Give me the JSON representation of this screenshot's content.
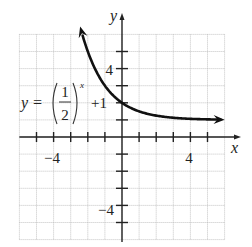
{
  "chart_data": {
    "type": "line",
    "title": "",
    "function": "y = (1/2)^x + 1",
    "equation_label": {
      "lhs": "y =",
      "numerator": "1",
      "denominator": "2",
      "exponent": "x",
      "suffix": "+1"
    },
    "xlabel": "x",
    "ylabel": "y",
    "xlim": [
      -6,
      6
    ],
    "ylim": [
      -6,
      6
    ],
    "grid": true,
    "grid_step": 1,
    "x_tick_labels": [
      {
        "value": -4,
        "label": "−4"
      },
      {
        "value": 4,
        "label": "4"
      }
    ],
    "y_tick_labels": [
      {
        "value": 4,
        "label": "4"
      },
      {
        "value": -4,
        "label": "−4"
      }
    ],
    "asymptote": 1,
    "y_intercept": 2,
    "series": [
      {
        "name": "y = (1/2)^x + 1",
        "x": [
          -2.5,
          -2,
          -1.5,
          -1,
          -0.5,
          0,
          0.5,
          1,
          1.5,
          2,
          3,
          4,
          5,
          6
        ],
        "y": [
          6.66,
          5,
          3.83,
          3,
          2.41,
          2,
          1.71,
          1.5,
          1.35,
          1.25,
          1.125,
          1.0625,
          1.03,
          1.016
        ]
      }
    ],
    "colors": {
      "curve": "#111111",
      "axes": "#222222",
      "grid": "#b5b5b5"
    }
  }
}
